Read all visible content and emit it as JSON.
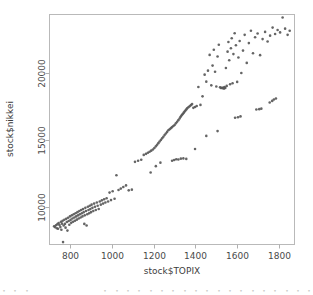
{
  "chart_data": {
    "type": "scatter",
    "title": "",
    "xlabel": "stock$TOPIX",
    "ylabel": "stock$nikkei",
    "xlim": [
      700,
      1875
    ],
    "ylim": [
      7200,
      24400
    ],
    "xticks": [
      800,
      1000,
      1200,
      1400,
      1600,
      1800
    ],
    "yticks": [
      10000,
      15000,
      20000
    ],
    "xtick_labels": [
      "800",
      "1000",
      "1200",
      "1400",
      "1600",
      "1800"
    ],
    "ytick_labels": [
      "10000",
      "15000",
      "20000"
    ],
    "grid": false,
    "legend": null,
    "marker": {
      "shape": "circle",
      "color": "#585858",
      "size_px": 2.6,
      "filled": true
    },
    "series": [
      {
        "name": "nikkei vs TOPIX",
        "n_points": 190,
        "points": [
          [
            722,
            8560
          ],
          [
            726,
            8500
          ],
          [
            731,
            8640
          ],
          [
            735,
            8420
          ],
          [
            738,
            8720
          ],
          [
            741,
            8380
          ],
          [
            744,
            8810
          ],
          [
            748,
            8660
          ],
          [
            752,
            8500
          ],
          [
            755,
            8900
          ],
          [
            757,
            8300
          ],
          [
            760,
            8760
          ],
          [
            763,
            8980
          ],
          [
            765,
            7380
          ],
          [
            768,
            8620
          ],
          [
            771,
            9050
          ],
          [
            774,
            8740
          ],
          [
            777,
            8460
          ],
          [
            780,
            9120
          ],
          [
            783,
            8880
          ],
          [
            786,
            8240
          ],
          [
            789,
            9200
          ],
          [
            792,
            8960
          ],
          [
            795,
            8680
          ],
          [
            798,
            9300
          ],
          [
            801,
            9040
          ],
          [
            804,
            8820
          ],
          [
            807,
            9380
          ],
          [
            810,
            9140
          ],
          [
            813,
            8900
          ],
          [
            816,
            9460
          ],
          [
            819,
            9220
          ],
          [
            822,
            8980
          ],
          [
            825,
            9540
          ],
          [
            828,
            9300
          ],
          [
            831,
            9060
          ],
          [
            834,
            9620
          ],
          [
            837,
            9380
          ],
          [
            840,
            9140
          ],
          [
            843,
            9700
          ],
          [
            846,
            9460
          ],
          [
            849,
            9220
          ],
          [
            852,
            9780
          ],
          [
            855,
            9540
          ],
          [
            858,
            9300
          ],
          [
            861,
            9860
          ],
          [
            864,
            9620
          ],
          [
            867,
            8740
          ],
          [
            869,
            9380
          ],
          [
            872,
            9940
          ],
          [
            875,
            9700
          ],
          [
            878,
            8620
          ],
          [
            881,
            9460
          ],
          [
            884,
            10020
          ],
          [
            887,
            9780
          ],
          [
            890,
            9540
          ],
          [
            893,
            10100
          ],
          [
            896,
            9860
          ],
          [
            899,
            9620
          ],
          [
            902,
            10180
          ],
          [
            906,
            9940
          ],
          [
            910,
            9700
          ],
          [
            914,
            10260
          ],
          [
            918,
            10020
          ],
          [
            922,
            9780
          ],
          [
            927,
            10340
          ],
          [
            931,
            10100
          ],
          [
            936,
            9860
          ],
          [
            941,
            10420
          ],
          [
            946,
            10180
          ],
          [
            951,
            10500
          ],
          [
            957,
            10260
          ],
          [
            962,
            10580
          ],
          [
            968,
            10340
          ],
          [
            974,
            10660
          ],
          [
            981,
            10420
          ],
          [
            988,
            11080
          ],
          [
            995,
            10520
          ],
          [
            1003,
            11180
          ],
          [
            1012,
            10620
          ],
          [
            1021,
            12380
          ],
          [
            1031,
            11280
          ],
          [
            1042,
            11380
          ],
          [
            1054,
            11500
          ],
          [
            1067,
            11620
          ],
          [
            1080,
            11250
          ],
          [
            1095,
            11300
          ],
          [
            1110,
            13380
          ],
          [
            1125,
            13460
          ],
          [
            1140,
            13540
          ],
          [
            1152,
            13900
          ],
          [
            1163,
            13980
          ],
          [
            1172,
            14060
          ],
          [
            1180,
            14140
          ],
          [
            1188,
            14220
          ],
          [
            1196,
            14300
          ],
          [
            1203,
            14420
          ],
          [
            1210,
            14540
          ],
          [
            1216,
            14660
          ],
          [
            1222,
            14780
          ],
          [
            1228,
            14900
          ],
          [
            1234,
            15020
          ],
          [
            1240,
            15140
          ],
          [
            1246,
            15260
          ],
          [
            1252,
            15380
          ],
          [
            1258,
            15500
          ],
          [
            1264,
            15620
          ],
          [
            1270,
            15740
          ],
          [
            1276,
            15820
          ],
          [
            1282,
            15900
          ],
          [
            1288,
            15980
          ],
          [
            1294,
            16060
          ],
          [
            1300,
            16140
          ],
          [
            1306,
            16260
          ],
          [
            1312,
            16380
          ],
          [
            1318,
            16500
          ],
          [
            1324,
            16620
          ],
          [
            1328,
            16740
          ],
          [
            1332,
            16820
          ],
          [
            1336,
            16900
          ],
          [
            1340,
            16980
          ],
          [
            1344,
            17060
          ],
          [
            1348,
            17140
          ],
          [
            1352,
            17220
          ],
          [
            1356,
            17300
          ],
          [
            1360,
            17380
          ],
          [
            1366,
            17460
          ],
          [
            1372,
            17540
          ],
          [
            1378,
            17620
          ],
          [
            1384,
            17700
          ],
          [
            1390,
            17420
          ],
          [
            1398,
            17480
          ],
          [
            1406,
            17560
          ],
          [
            1414,
            18980
          ],
          [
            1424,
            17640
          ],
          [
            1434,
            18280
          ],
          [
            1444,
            19900
          ],
          [
            1452,
            19380
          ],
          [
            1460,
            20200
          ],
          [
            1468,
            21380
          ],
          [
            1476,
            19100
          ],
          [
            1482,
            20580
          ],
          [
            1488,
            21760
          ],
          [
            1494,
            20120
          ],
          [
            1500,
            19020
          ],
          [
            1506,
            21260
          ],
          [
            1512,
            22140
          ],
          [
            1518,
            18960
          ],
          [
            1522,
            18900
          ],
          [
            1526,
            18920
          ],
          [
            1530,
            18880
          ],
          [
            1534,
            18940
          ],
          [
            1537,
            18860
          ],
          [
            1540,
            18980
          ],
          [
            1543,
            18900
          ],
          [
            1546,
            20400
          ],
          [
            1550,
            19060
          ],
          [
            1554,
            21620
          ],
          [
            1558,
            22340
          ],
          [
            1562,
            20980
          ],
          [
            1566,
            19180
          ],
          [
            1570,
            21880
          ],
          [
            1574,
            22620
          ],
          [
            1578,
            19260
          ],
          [
            1582,
            21440
          ],
          [
            1588,
            23000
          ],
          [
            1594,
            22100
          ],
          [
            1600,
            19360
          ],
          [
            1606,
            21180
          ],
          [
            1612,
            22420
          ],
          [
            1620,
            20020
          ],
          [
            1628,
            21700
          ],
          [
            1636,
            22880
          ],
          [
            1646,
            20780
          ],
          [
            1656,
            22260
          ],
          [
            1666,
            23180
          ],
          [
            1676,
            21500
          ],
          [
            1686,
            22700
          ],
          [
            1698,
            22980
          ],
          [
            1710,
            21360
          ],
          [
            1722,
            22560
          ],
          [
            1734,
            23100
          ],
          [
            1746,
            22380
          ],
          [
            1758,
            22820
          ],
          [
            1770,
            23420
          ],
          [
            1782,
            22940
          ],
          [
            1794,
            23240
          ],
          [
            1806,
            23060
          ],
          [
            1818,
            24180
          ],
          [
            1830,
            23340
          ],
          [
            1842,
            22880
          ],
          [
            1852,
            23180
          ]
        ],
        "lower_branch_points": [
          [
            1185,
            12580
          ],
          [
            1210,
            13060
          ],
          [
            1232,
            13320
          ],
          [
            1288,
            13460
          ],
          [
            1298,
            13520
          ],
          [
            1308,
            13580
          ],
          [
            1318,
            13560
          ],
          [
            1330,
            13620
          ],
          [
            1342,
            13640
          ],
          [
            1356,
            13600
          ],
          [
            1398,
            14340
          ],
          [
            1452,
            15320
          ],
          [
            1506,
            15680
          ],
          [
            1590,
            16680
          ],
          [
            1604,
            16720
          ],
          [
            1616,
            16780
          ],
          [
            1692,
            17300
          ],
          [
            1706,
            17320
          ],
          [
            1716,
            17360
          ],
          [
            1756,
            17820
          ],
          [
            1768,
            17940
          ],
          [
            1776,
            18040
          ],
          [
            1786,
            18120
          ]
        ]
      }
    ]
  },
  "bottom_fragment": {
    "text": "・ ・ ・　　　　　　　　 ・ ・ ・ ・ ・ ・ ・ ・ ・ ・ ・ ・ ・ ・ ・ ・ ・ ・ ・ ・ ・ ・ ・ ・ ・ ・ ・"
  }
}
